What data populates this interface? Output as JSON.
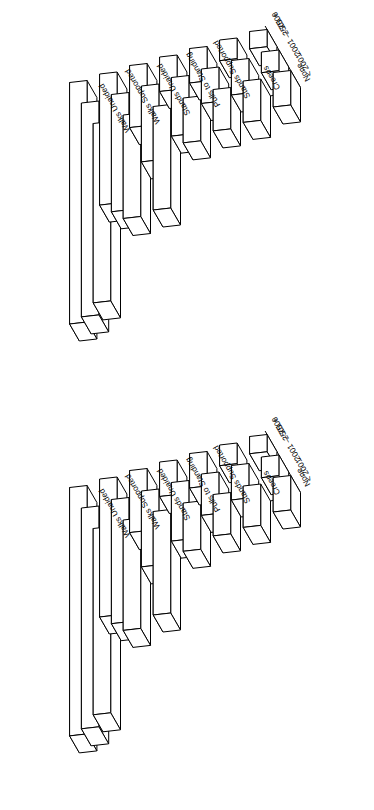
{
  "figure": {
    "background_color": "#ffffff",
    "line_color": "#000000",
    "page_orientation": "rotated-90",
    "panel_count": 2
  },
  "axis_labels": {
    "depth_axis_title": "Birthweight (gm)",
    "birthweight_groups": [
      "< 2001",
      "2001 — 2500",
      "2501 +"
    ],
    "milestones": [
      "Walks Unaided",
      "Walks Supported",
      "Stands Unaided",
      "Pulls to Standing",
      "Stands Supported",
      "Creeps",
      "None"
    ]
  },
  "chart_data": [
    {
      "id": "panel-top",
      "type": "bar",
      "title": "",
      "subtitle": "",
      "projection": "3d-isometric",
      "xlabel": "Birthweight (gm)",
      "ylabel": "",
      "zlabel": "",
      "grid": false,
      "legend": "none",
      "categories": [
        "Walks Unaided",
        "Walks Supported",
        "Stands Unaided",
        "Pulls to Standing",
        "Stands Supported",
        "Creeps",
        "None"
      ],
      "series": [
        {
          "name": "< 2001",
          "values": [
            52,
            30,
            30,
            13,
            12,
            12,
            10
          ]
        },
        {
          "name": "2001 — 2500",
          "values": [
            62,
            34,
            22,
            17,
            10,
            10,
            6
          ]
        },
        {
          "name": "2501 +",
          "values": [
            70,
            38,
            18,
            10,
            10,
            6,
            5
          ]
        }
      ],
      "zlim": [
        0,
        75
      ]
    },
    {
      "id": "panel-bottom",
      "type": "bar",
      "title": "",
      "subtitle": "",
      "projection": "3d-isometric",
      "xlabel": "Birthweight (gm)",
      "ylabel": "",
      "zlabel": "",
      "grid": false,
      "legend": "none",
      "categories": [
        "Walks Unaided",
        "Walks Supported",
        "Stands Unaided",
        "Pulls to Standing",
        "Stands Supported",
        "Creeps",
        "None"
      ],
      "series": [
        {
          "name": "< 2001",
          "values": [
            54,
            32,
            30,
            14,
            12,
            12,
            10
          ]
        },
        {
          "name": "2001 — 2500",
          "values": [
            64,
            36,
            22,
            17,
            12,
            10,
            6
          ]
        },
        {
          "name": "2501 +",
          "values": [
            72,
            40,
            18,
            10,
            10,
            6,
            5
          ]
        }
      ],
      "zlim": [
        0,
        75
      ]
    }
  ]
}
